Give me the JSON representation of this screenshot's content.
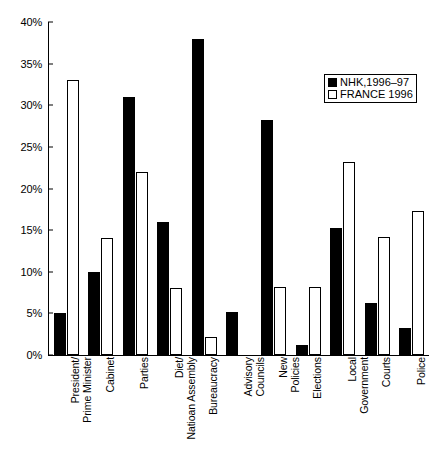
{
  "chart_data": {
    "type": "bar",
    "title": "",
    "xlabel": "",
    "ylabel": "",
    "ylim": [
      0,
      40
    ],
    "ytick_labels": [
      "40%",
      "35%",
      "30%",
      "25%",
      "20%",
      "15%",
      "10%",
      "5%",
      "0%"
    ],
    "ytick_values": [
      40,
      35,
      30,
      25,
      20,
      15,
      10,
      5,
      0
    ],
    "grid": false,
    "legend_position": "top-right",
    "categories": [
      "President/ Prime Minister",
      "Cabinet",
      "Parties",
      "Diet/ Natioan Assembly",
      "Bureaucracy",
      "Advisory Councils",
      "New Policies",
      "Elections",
      "Local Government",
      "Courts",
      "Police"
    ],
    "category_lines": [
      [
        "President/",
        "Prime Minister"
      ],
      [
        "Cabinet",
        ""
      ],
      [
        "Parties",
        ""
      ],
      [
        "Diet/",
        "Natioan Assembly"
      ],
      [
        "Bureaucracy",
        ""
      ],
      [
        "Advisory",
        "Councils"
      ],
      [
        "New",
        "Policies"
      ],
      [
        "Elections",
        ""
      ],
      [
        "Local",
        "Government"
      ],
      [
        "Courts",
        ""
      ],
      [
        "Police",
        ""
      ]
    ],
    "series": [
      {
        "name": "NHK,1996–97",
        "color": "#000000",
        "values": [
          5.0,
          10.0,
          31.0,
          16.0,
          38.0,
          5.2,
          28.2,
          1.2,
          15.2,
          6.2,
          3.2
        ]
      },
      {
        "name": "FRANCE 1996",
        "color": "#ffffff",
        "values": [
          33.0,
          14.0,
          22.0,
          8.0,
          2.2,
          0.0,
          8.2,
          8.2,
          23.2,
          14.2,
          17.3
        ]
      }
    ]
  },
  "legend": {
    "items": [
      {
        "label": "NHK,1996–97",
        "swatch": "filled-black-square"
      },
      {
        "label": "FRANCE 1996",
        "swatch": "empty-white-square"
      }
    ]
  }
}
